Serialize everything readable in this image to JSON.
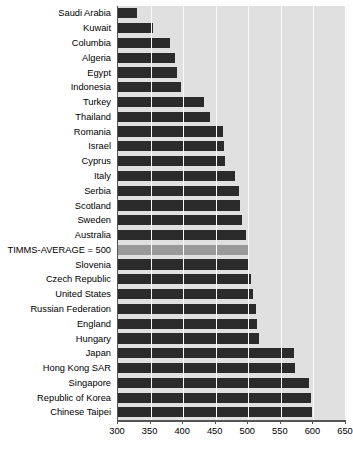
{
  "chart_data": {
    "type": "bar",
    "orientation": "horizontal",
    "title": "",
    "subtitle": "",
    "xlabel": "",
    "ylabel": "",
    "xlim": [
      300,
      650
    ],
    "xticks": [
      300,
      350,
      400,
      450,
      500,
      550,
      600,
      650
    ],
    "grid": true,
    "legend": false,
    "plot_background_color": "#e0e0e0",
    "bar_color": "#2b2b2b",
    "highlight_bar_color": "#999999",
    "gridline_color": "#fafafa",
    "highlight_category": "TIMMS-AVERAGE = 500",
    "categories": [
      "Saudi Arabia",
      "Kuwait",
      "Columbia",
      "Algeria",
      "Egypt",
      "Indonesia",
      "Turkey",
      "Thailand",
      "Romania",
      "Israel",
      "Cyprus",
      "Italy",
      "Serbia",
      "Scotland",
      "Sweden",
      "Australia",
      "TIMMS-AVERAGE = 500",
      "Slovenia",
      "Czech Republic",
      "United States",
      "Russian Federation",
      "England",
      "Hungary",
      "Japan",
      "Hong Kong SAR",
      "Singapore",
      "Republic of Korea",
      "Chinese Taipei"
    ],
    "values": [
      329,
      354,
      380,
      387,
      391,
      397,
      432,
      441,
      461,
      463,
      465,
      480,
      486,
      487,
      491,
      496,
      500,
      501,
      504,
      508,
      512,
      513,
      517,
      570,
      572,
      593,
      597,
      598
    ]
  },
  "axis": {
    "ticks": [
      "300",
      "350",
      "400",
      "450",
      "500",
      "550",
      "600",
      "650"
    ]
  }
}
